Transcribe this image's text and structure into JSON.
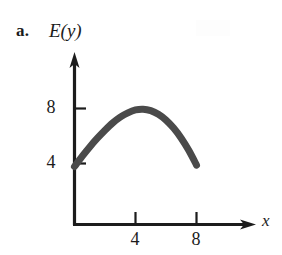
{
  "figure": {
    "part_label": "a.",
    "y_axis_label": "E(y)",
    "x_axis_label": "x",
    "line_color": "#4a4a4a",
    "axis_color": "#1c1c1c",
    "background_color": "#ffffff"
  },
  "chart_data": {
    "type": "line",
    "title": "",
    "subtitle": "",
    "xlabel": "x",
    "ylabel": "E(y)",
    "xlim": [
      0,
      10
    ],
    "ylim": [
      0,
      11
    ],
    "grid": false,
    "legend": null,
    "xticks": [
      4,
      8
    ],
    "xtick_labels": [
      "4",
      "8"
    ],
    "yticks": [
      4,
      8
    ],
    "ytick_labels": [
      "4",
      "8"
    ],
    "annotations": [],
    "series": [
      {
        "name": "E(y)",
        "color": "#4a4a4a",
        "x": [
          0,
          0.5,
          1,
          1.5,
          2,
          2.5,
          3,
          3.5,
          4,
          4.5,
          5,
          5.5,
          6,
          6.5,
          7,
          7.5,
          8
        ],
        "y": [
          4.0,
          4.7,
          5.35,
          5.95,
          6.5,
          7.0,
          7.4,
          7.7,
          7.9,
          7.95,
          7.85,
          7.6,
          7.2,
          6.65,
          5.95,
          5.1,
          4.1
        ]
      }
    ]
  }
}
